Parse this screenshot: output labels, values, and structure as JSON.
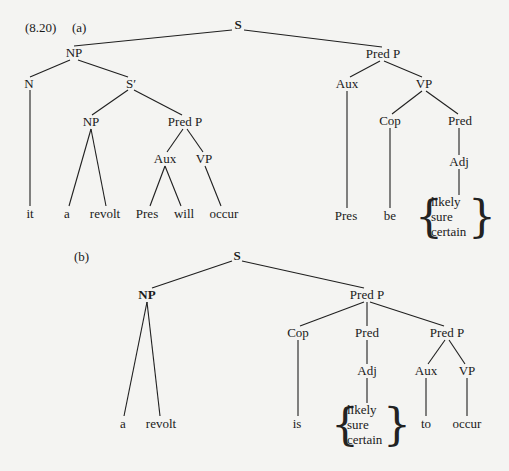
{
  "figure": {
    "number": "(8.20)",
    "colors": {
      "background": "#f4f4f2",
      "ink": "#1a1a1a"
    }
  },
  "tree_a": {
    "label": "(a)",
    "nodes": {
      "S": "S",
      "NP": "NP",
      "N": "N",
      "S_prime": "S′",
      "NP_inner": "NP",
      "PredP_inner": "Pred P",
      "Aux_inner": "Aux",
      "VP_inner": "VP",
      "PredP": "Pred P",
      "Aux": "Aux",
      "VP": "VP",
      "Cop": "Cop",
      "Pred": "Pred",
      "Adj": "Adj"
    },
    "terminals": {
      "it": "it",
      "a": "a",
      "revolt": "revolt",
      "Pres_inner": "Pres",
      "will": "will",
      "occur": "occur",
      "Pres": "Pres",
      "be": "be"
    },
    "adjective_options": [
      "likely",
      "sure",
      "certain"
    ]
  },
  "tree_b": {
    "label": "(b)",
    "nodes": {
      "S": "S",
      "NP": "NP",
      "PredP": "Pred P",
      "Cop": "Cop",
      "Pred": "Pred",
      "PredP_inner": "Pred P",
      "Adj": "Adj",
      "Aux": "Aux",
      "VP": "VP"
    },
    "terminals": {
      "a": "a",
      "revolt": "revolt",
      "is": "is",
      "to": "to",
      "occur": "occur"
    },
    "adjective_options": [
      "likely",
      "sure",
      "certain"
    ]
  },
  "braces": {
    "left": "{",
    "right": "}"
  }
}
